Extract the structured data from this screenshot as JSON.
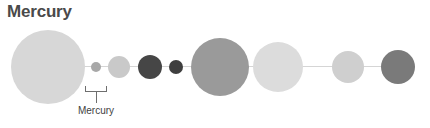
{
  "diagram": {
    "title": "Mercury",
    "type": "solar-system-size-comparison",
    "background_color": "#ffffff",
    "orbit_line": {
      "color": "#d5d5d5",
      "x_start": 46,
      "x_end": 398,
      "y": 66
    },
    "callout": {
      "label": "Mercury",
      "line_color": "#6e6e6e",
      "target_body": "mercury"
    },
    "bodies": [
      {
        "name": "sun",
        "label": "Sun",
        "cx": 48,
        "cy": 67,
        "r": 37,
        "color": "#d7d7d7"
      },
      {
        "name": "mercury",
        "label": "Mercury",
        "cx": 96,
        "cy": 67,
        "r": 5,
        "color": "#a8a8a8"
      },
      {
        "name": "venus",
        "label": "Venus",
        "cx": 119,
        "cy": 67,
        "r": 11,
        "color": "#c9c9c9"
      },
      {
        "name": "earth",
        "label": "Earth",
        "cx": 150,
        "cy": 67,
        "r": 12,
        "color": "#464646"
      },
      {
        "name": "mars",
        "label": "Mars",
        "cx": 176,
        "cy": 67,
        "r": 7,
        "color": "#3f3f3f"
      },
      {
        "name": "jupiter",
        "label": "Jupiter",
        "cx": 220,
        "cy": 67,
        "r": 29,
        "color": "#9a9a9a"
      },
      {
        "name": "saturn",
        "label": "Saturn",
        "cx": 278,
        "cy": 67,
        "r": 25,
        "color": "#dcdcdc"
      },
      {
        "name": "uranus",
        "label": "Uranus",
        "cx": 348,
        "cy": 67,
        "r": 16,
        "color": "#cfcfcf"
      },
      {
        "name": "neptune",
        "label": "Neptune",
        "cx": 398,
        "cy": 67,
        "r": 17,
        "color": "#7a7a7a"
      }
    ]
  }
}
